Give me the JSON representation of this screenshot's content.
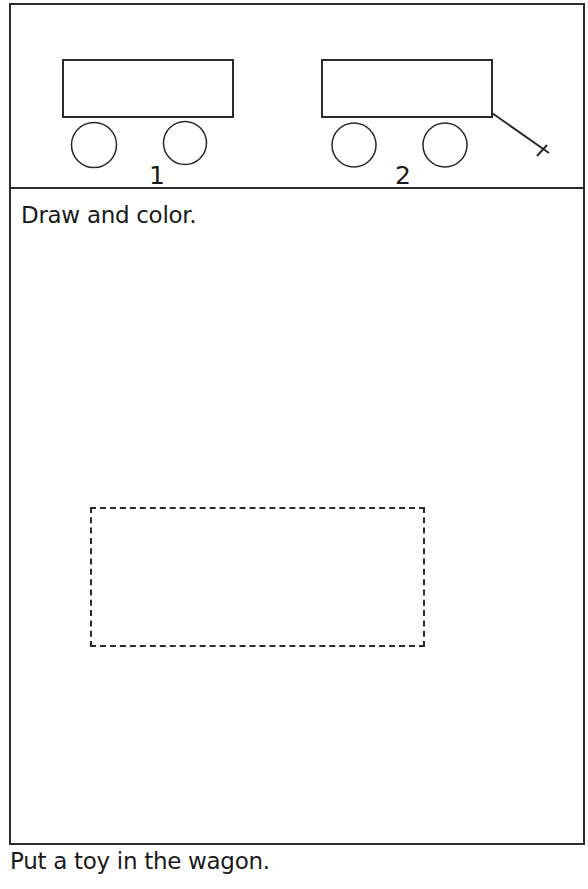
{
  "top_panel": {
    "wagons": [
      {
        "number": "1",
        "has_handle": false
      },
      {
        "number": "2",
        "has_handle": true
      }
    ]
  },
  "instruction": "Draw and color.",
  "footer": {
    "line1": "Put a toy in the wagon.",
    "line2_partial": ""
  },
  "colors": {
    "line": "#2a2a2a",
    "background": "#ffffff"
  }
}
